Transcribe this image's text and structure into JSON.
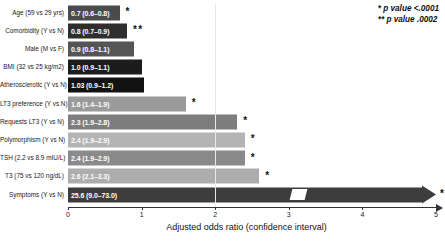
{
  "legend": {
    "lines": [
      {
        "marks": "*",
        "text": "p value <.0001"
      },
      {
        "marks": "**",
        "text": "p value .0002"
      }
    ]
  },
  "axis": {
    "title": "Adjusted odds ratio (confidence interval)",
    "ticks": [
      "0",
      "1",
      "2",
      "3",
      "4",
      "5"
    ]
  },
  "chart_data": {
    "type": "bar",
    "orientation": "horizontal",
    "title": "",
    "xlabel": "Adjusted odds ratio (confidence interval)",
    "ylabel": "",
    "xlim": [
      0,
      5
    ],
    "tick_values": [
      0,
      1,
      2,
      3,
      4,
      5
    ],
    "grid": false,
    "legend_position": "top-right",
    "categories": [
      "Age (59 vs 29 yrs)",
      "Comorbidity (Y vs N)",
      "Male (M vs F)",
      "BMI (32 vs 25 kg/m2)",
      "Atherosclerotic (Y vs N)",
      "LT3 preference (Y vs N)",
      "Requests LT3 (Y vs N)",
      "Polymorphism (Y vs N)",
      "TSH (2.2 vs 8.9 mIU/L)",
      "T3 (75 vs 120 ng/dL)",
      "Symptoms (Y vs N)"
    ],
    "values": [
      0.7,
      0.8,
      0.9,
      1.0,
      1.03,
      1.6,
      2.3,
      2.4,
      2.4,
      2.6,
      25.6
    ],
    "ci_low": [
      0.6,
      0.7,
      0.8,
      0.9,
      0.9,
      1.4,
      1.9,
      1.9,
      1.9,
      2.1,
      9.0
    ],
    "ci_high": [
      0.8,
      0.9,
      1.1,
      1.1,
      1.2,
      1.9,
      2.8,
      2.9,
      2.9,
      3.3,
      73.0
    ],
    "data_labels": [
      "0.7 (0.6–0.8)",
      "0.8 (0.7–0.9)",
      "0.9 (0.8–1.1)",
      "1.0 (0.9–1.1)",
      "1.03 (0.9–1.2)",
      "1.6 (1.4–1.9)",
      "2.3 (1.9–2.8)",
      "2.4 (1.9–2.9)",
      "2.4 (1.9–2.9)",
      "2.6 (2.1–3.3)",
      "25.6 (9.0–73.0)"
    ],
    "significance": [
      "*",
      "**",
      "",
      "",
      "",
      "*",
      "*",
      "*",
      "*",
      "*",
      "*"
    ],
    "bar_colors": [
      "#4b4b4b",
      "#2e2e2e",
      "#555555",
      "#1c1c1c",
      "#121212",
      "#9a9a9a",
      "#7d7d7d",
      "#b4b4b4",
      "#8a8a8a",
      "#adadad",
      "#3d3d3d"
    ],
    "truncated_bars": [
      10
    ]
  }
}
